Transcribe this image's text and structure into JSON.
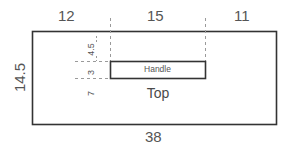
{
  "drawing": {
    "title": "Top view dimensioned drawing",
    "line_color": "#333333",
    "dim_color": "#555555",
    "dash_color": "#9a9a9a",
    "background": "#ffffff",
    "parts": {
      "outer_label": "Top",
      "inner_label": "Handle"
    },
    "dimensions": {
      "overall_width": "38",
      "overall_height": "14.5",
      "top_segment_left": "12",
      "top_segment_middle": "15",
      "top_segment_right": "11",
      "inner_offset_top": "4.5",
      "inner_height": "3",
      "inner_offset_bottom": "7"
    }
  }
}
